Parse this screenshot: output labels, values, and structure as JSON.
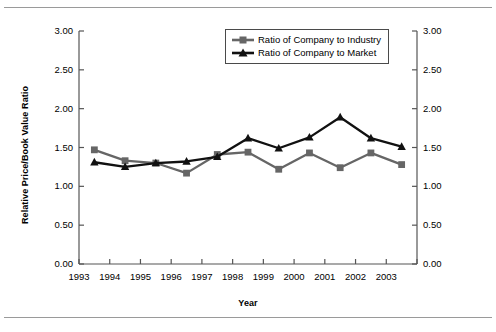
{
  "chart_data": {
    "type": "line",
    "title": "",
    "xlabel": "Year",
    "ylabel": "Relative Price/Book Value Ratio",
    "ylim": [
      0.0,
      3.0
    ],
    "ytick_step": 0.5,
    "grid": false,
    "legend_position": "top-center",
    "dual_y_axis": true,
    "categories": [
      "1993",
      "1994",
      "1995",
      "1996",
      "1997",
      "1998",
      "1999",
      "2000",
      "2001",
      "2002",
      "2003"
    ],
    "x_tick_labels": [
      "1993",
      "1994",
      "1995",
      "1996",
      "1997",
      "1998",
      "1999",
      "2000",
      "2001",
      "2002",
      "2003"
    ],
    "y_tick_labels_left": [
      "3.00",
      "2.50",
      "2.00",
      "1.50",
      "1.00",
      "0.50",
      "0.00"
    ],
    "y_tick_labels_right": [
      "3.00",
      "2.50",
      "2.00",
      "1.50",
      "1.00",
      "0.50",
      "0.00"
    ],
    "y_tick_values": [
      3.0,
      2.5,
      2.0,
      1.5,
      1.0,
      0.5,
      0.0
    ],
    "series": [
      {
        "name": "Ratio of Company to Industry",
        "marker": "square",
        "color": "#666666",
        "values": [
          1.47,
          1.33,
          1.3,
          1.17,
          1.41,
          1.44,
          1.22,
          1.43,
          1.24,
          1.43,
          1.28
        ]
      },
      {
        "name": "Ratio of Company to Market",
        "marker": "triangle",
        "color": "#111111",
        "values": [
          1.31,
          1.25,
          1.3,
          1.32,
          1.38,
          1.62,
          1.49,
          1.63,
          1.89,
          1.62,
          1.51
        ]
      }
    ]
  },
  "legend": {
    "items": [
      {
        "label": "Ratio of Company to Industry"
      },
      {
        "label": "Ratio of Company to Market"
      }
    ]
  },
  "axes": {
    "x_title": "Year",
    "y_title": "Relative Price/Book Value Ratio"
  },
  "colors": {
    "industry": "#666666",
    "market": "#111111",
    "axis": "#555555",
    "rule": "#9a9a9a",
    "background": "#ffffff"
  }
}
